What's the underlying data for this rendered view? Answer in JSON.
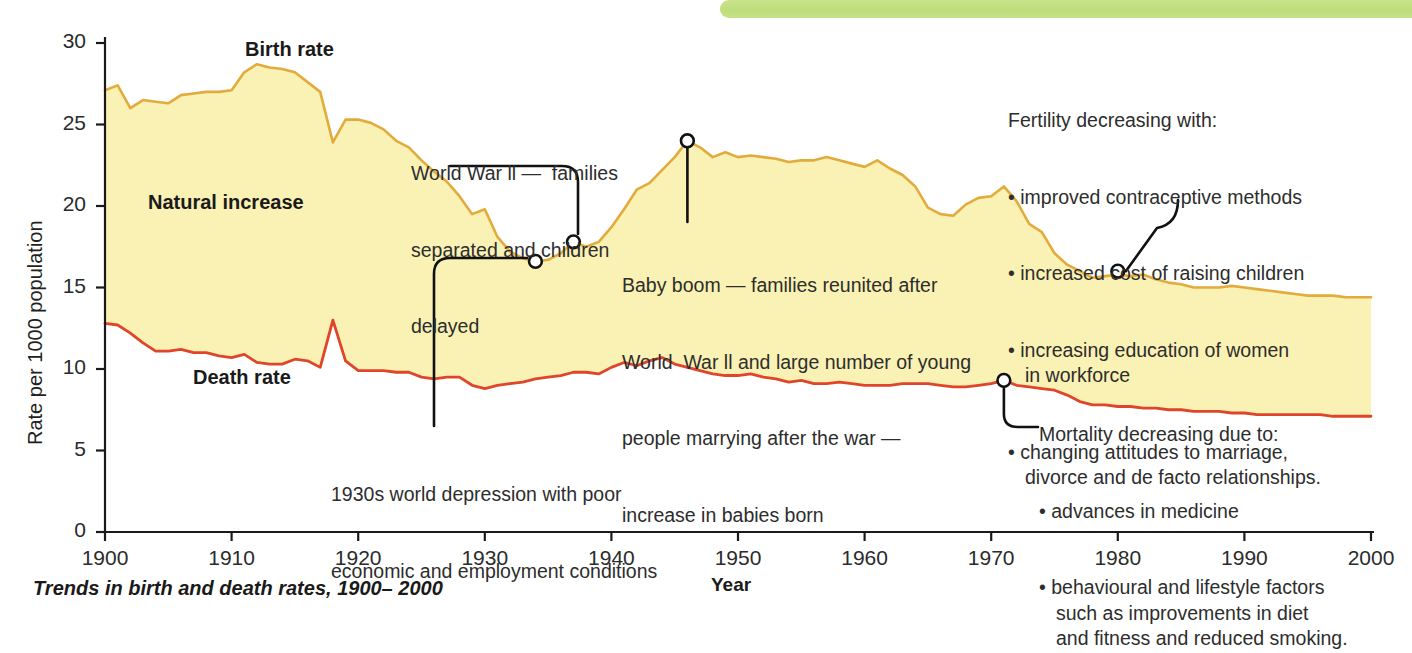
{
  "colors": {
    "birth_line": "#e2ab3c",
    "death_line": "#e0452a",
    "area_fill": "#faf1b4",
    "axis": "#1a1a1a",
    "green_band": "#c6e288",
    "text": "#2d2d2d"
  },
  "decor": {
    "green_band_name": "green-header-band"
  },
  "caption": "Trends in birth and death rates, 1900– 2000",
  "series_labels": {
    "birth": "Birth rate",
    "death": "Death rate",
    "natural_increase": "Natural increase"
  },
  "annotations": {
    "ww2": {
      "lines": [
        "World War ll —  families",
        "separated and children",
        "delayed"
      ],
      "marker_year": 1937,
      "marker_value": 17.8
    },
    "depression": {
      "lines": [
        "1930s world depression with poor",
        "economic and employment conditions"
      ],
      "marker_year": 1934,
      "marker_value": 16.6
    },
    "baby_boom": {
      "lines": [
        "Baby boom — families reunited after",
        "World  War ll and large number of young",
        "people marrying after the war —",
        "increase in babies born"
      ],
      "marker_year": 1946,
      "marker_value": 24.0
    },
    "fertility": {
      "title": "Fertility decreasing with:",
      "bullets": [
        "improved contraceptive methods",
        "increased cost of raising children",
        "increasing education of women\nin workforce",
        "changing attitudes to marriage,\ndivorce and de facto relationships."
      ],
      "marker_year": 1980,
      "marker_value": 16.0
    },
    "mortality": {
      "title": "Mortality decreasing due to:",
      "bullets": [
        "advances in medicine",
        "behavioural and lifestyle factors\nsuch as improvements in diet\nand fitness and reduced smoking."
      ],
      "marker_year": 1971,
      "marker_value": 9.3
    }
  },
  "chart_data": {
    "type": "area",
    "title": "Trends in birth and death rates, 1900– 2000",
    "xlabel": "Year",
    "ylabel": "Rate per 1000 population",
    "xlim": [
      1900,
      2000
    ],
    "ylim": [
      0,
      30
    ],
    "xticks": [
      1900,
      1910,
      1920,
      1930,
      1940,
      1950,
      1960,
      1970,
      1980,
      1990,
      2000
    ],
    "yticks": [
      0,
      5,
      10,
      15,
      20,
      25,
      30
    ],
    "grid": false,
    "legend": "inline-labels",
    "x": [
      1900,
      1901,
      1902,
      1903,
      1904,
      1905,
      1906,
      1907,
      1908,
      1909,
      1910,
      1911,
      1912,
      1913,
      1914,
      1915,
      1916,
      1917,
      1918,
      1919,
      1920,
      1921,
      1922,
      1923,
      1924,
      1925,
      1926,
      1927,
      1928,
      1929,
      1930,
      1931,
      1932,
      1933,
      1934,
      1935,
      1936,
      1937,
      1938,
      1939,
      1940,
      1941,
      1942,
      1943,
      1944,
      1945,
      1946,
      1947,
      1948,
      1949,
      1950,
      1951,
      1952,
      1953,
      1954,
      1955,
      1956,
      1957,
      1958,
      1959,
      1960,
      1961,
      1962,
      1963,
      1964,
      1965,
      1966,
      1967,
      1968,
      1969,
      1970,
      1971,
      1972,
      1973,
      1974,
      1975,
      1976,
      1977,
      1978,
      1979,
      1980,
      1981,
      1982,
      1983,
      1984,
      1985,
      1986,
      1987,
      1988,
      1989,
      1990,
      1991,
      1992,
      1993,
      1994,
      1995,
      1996,
      1997,
      1998,
      1999,
      2000
    ],
    "series": [
      {
        "name": "Birth rate",
        "color": "#e2ab3c",
        "values": [
          27.1,
          27.4,
          26.0,
          26.5,
          26.4,
          26.3,
          26.8,
          26.9,
          27.0,
          27.0,
          27.1,
          28.2,
          28.7,
          28.5,
          28.4,
          28.2,
          27.6,
          27.0,
          23.9,
          25.3,
          25.3,
          25.1,
          24.7,
          24.0,
          23.6,
          22.8,
          22.1,
          21.5,
          20.6,
          19.5,
          19.8,
          18.1,
          17.2,
          16.8,
          16.6,
          16.7,
          17.1,
          17.8,
          17.5,
          17.8,
          18.7,
          19.8,
          21.0,
          21.4,
          22.2,
          23.0,
          24.0,
          23.6,
          23.0,
          23.3,
          23.0,
          23.1,
          23.0,
          22.9,
          22.7,
          22.8,
          22.8,
          23.0,
          22.8,
          22.6,
          22.4,
          22.8,
          22.3,
          21.9,
          21.2,
          19.9,
          19.5,
          19.4,
          20.1,
          20.5,
          20.6,
          21.2,
          20.3,
          18.9,
          18.4,
          17.1,
          16.4,
          16.0,
          15.6,
          15.7,
          15.8,
          15.7,
          15.8,
          15.5,
          15.3,
          15.2,
          15.0,
          15.0,
          15.0,
          15.1,
          15.0,
          14.9,
          14.8,
          14.7,
          14.6,
          14.5,
          14.5,
          14.5,
          14.4,
          14.4,
          14.4
        ]
      },
      {
        "name": "Death rate",
        "color": "#e0452a",
        "values": [
          12.8,
          12.7,
          12.2,
          11.6,
          11.1,
          11.1,
          11.2,
          11.0,
          11.0,
          10.8,
          10.7,
          10.9,
          10.4,
          10.3,
          10.3,
          10.6,
          10.5,
          10.1,
          13.0,
          10.5,
          9.9,
          9.9,
          9.9,
          9.8,
          9.8,
          9.5,
          9.4,
          9.5,
          9.5,
          9.0,
          8.8,
          9.0,
          9.1,
          9.2,
          9.4,
          9.5,
          9.6,
          9.8,
          9.8,
          9.7,
          10.1,
          10.4,
          10.2,
          10.5,
          10.7,
          10.3,
          10.1,
          9.9,
          9.7,
          9.6,
          9.6,
          9.7,
          9.5,
          9.4,
          9.2,
          9.3,
          9.1,
          9.1,
          9.2,
          9.1,
          9.0,
          9.0,
          9.0,
          9.1,
          9.1,
          9.1,
          9.0,
          8.9,
          8.9,
          9.0,
          9.1,
          9.3,
          9.0,
          8.9,
          8.8,
          8.7,
          8.4,
          8.0,
          7.8,
          7.8,
          7.7,
          7.7,
          7.6,
          7.6,
          7.5,
          7.5,
          7.4,
          7.4,
          7.4,
          7.3,
          7.3,
          7.2,
          7.2,
          7.2,
          7.2,
          7.2,
          7.2,
          7.1,
          7.1,
          7.1,
          7.1
        ]
      }
    ]
  }
}
